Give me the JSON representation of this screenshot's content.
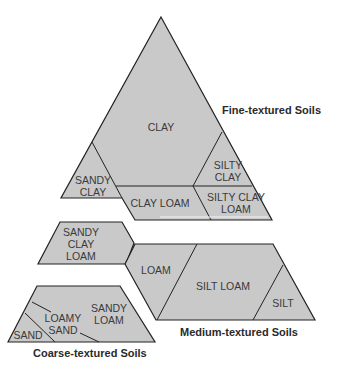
{
  "colors": {
    "fill": "#c9c9c9",
    "stroke": "#222222",
    "text": "#3a3a3a"
  },
  "groups": {
    "fine": {
      "label": "Fine-textured Soils",
      "classes": [
        "CLAY",
        "SANDY CLAY",
        "SILTY CLAY",
        "CLAY LOAM",
        "SILTY CLAY LOAM"
      ]
    },
    "medium": {
      "label": "Medium-textured Soils",
      "classes": [
        "SANDY CLAY LOAM",
        "LOAM",
        "SILT LOAM",
        "SILT"
      ]
    },
    "coarse": {
      "label": "Coarse-textured Soils",
      "classes": [
        "SAND",
        "LOAMY SAND",
        "SANDY LOAM"
      ]
    }
  },
  "labels": {
    "clay": "CLAY",
    "sandy_clay_1": "SANDY",
    "sandy_clay_2": "CLAY",
    "silty_clay_1": "SILTY",
    "silty_clay_2": "CLAY",
    "clay_loam": "CLAY LOAM",
    "silty_clay_loam_1": "SILTY CLAY",
    "silty_clay_loam_2": "LOAM",
    "sandy_clay_loam_1": "SANDY",
    "sandy_clay_loam_2": "CLAY",
    "sandy_clay_loam_3": "LOAM",
    "loam": "LOAM",
    "silt_loam": "SILT LOAM",
    "silt": "SILT",
    "sand": "SAND",
    "loamy_sand_1": "LOAMY",
    "loamy_sand_2": "SAND",
    "sandy_loam_1": "SANDY",
    "sandy_loam_2": "LOAM"
  }
}
